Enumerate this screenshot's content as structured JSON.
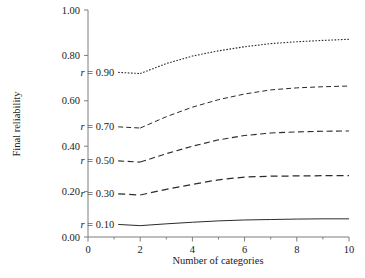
{
  "figure": {
    "caption": ""
  },
  "axes": {
    "y": {
      "title": "Final reliability",
      "ticks": [
        "0.00",
        "0.20",
        "0.40",
        "0.60",
        "0.80",
        "1.00"
      ],
      "min": 0,
      "max": 1
    },
    "x": {
      "title": "Number of categories",
      "ticks": [
        "0",
        "2",
        "4",
        "6",
        "8",
        "10"
      ],
      "minor_ticks": [
        "1",
        "3",
        "5",
        "7",
        "9"
      ],
      "min": 0,
      "max": 10
    }
  },
  "series_labels": [
    {
      "symbol": "r",
      "eq": " = ",
      "value": "0.90"
    },
    {
      "symbol": "r",
      "eq": " = ",
      "value": "0.70"
    },
    {
      "symbol": "r",
      "eq": " = ",
      "value": "0.50"
    },
    {
      "symbol": "r",
      "eq": " = ",
      "value": "0.30"
    },
    {
      "symbol": "r",
      "eq": " = ",
      "value": "0.10"
    }
  ],
  "chart_data": {
    "type": "line",
    "title": "",
    "xlabel": "Number of categories",
    "ylabel": "Final reliability",
    "xlim": [
      0,
      10
    ],
    "ylim": [
      0,
      1
    ],
    "xticks": [
      0,
      2,
      4,
      6,
      8,
      10
    ],
    "yticks": [
      0.0,
      0.2,
      0.4,
      0.6,
      0.8,
      1.0
    ],
    "grid": false,
    "legend": "inline-labels-left",
    "x": [
      2,
      3,
      4,
      5,
      6,
      7,
      8,
      9,
      10
    ],
    "series": [
      {
        "name": "r = 0.90",
        "r": 0.9,
        "label": "r = 0.90",
        "style": "dotted",
        "color": "#2b2b2b",
        "values": [
          0.72,
          0.764,
          0.797,
          0.82,
          0.838,
          0.852,
          0.86,
          0.866,
          0.871
        ]
      },
      {
        "name": "r = 0.70",
        "r": 0.7,
        "label": "r = 0.70",
        "style": "dashed-fine",
        "color": "#2b2b2b",
        "values": [
          0.48,
          0.53,
          0.572,
          0.605,
          0.63,
          0.648,
          0.657,
          0.662,
          0.665
        ]
      },
      {
        "name": "r = 0.50",
        "r": 0.5,
        "label": "r = 0.50",
        "style": "dashed",
        "color": "#2b2b2b",
        "values": [
          0.33,
          0.367,
          0.4,
          0.428,
          0.447,
          0.458,
          0.463,
          0.466,
          0.467
        ]
      },
      {
        "name": "r = 0.30",
        "r": 0.3,
        "label": "r = 0.30",
        "style": "dashed-wide",
        "color": "#2b2b2b",
        "values": [
          0.185,
          0.21,
          0.232,
          0.252,
          0.264,
          0.268,
          0.269,
          0.27,
          0.27
        ]
      },
      {
        "name": "r = 0.10",
        "r": 0.1,
        "label": "r = 0.10",
        "style": "solid",
        "color": "#2b2b2b",
        "values": [
          0.05,
          0.058,
          0.065,
          0.071,
          0.075,
          0.077,
          0.079,
          0.08,
          0.08
        ]
      }
    ]
  }
}
